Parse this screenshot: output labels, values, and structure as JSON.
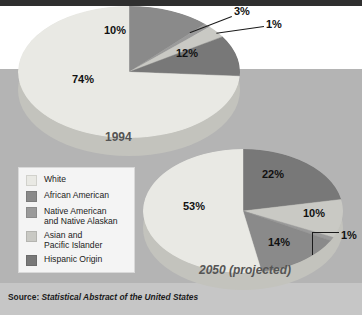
{
  "figure": {
    "source_prefix": "Source:",
    "source_title": "Statistical Abstract of the United States"
  },
  "legend": {
    "items": [
      {
        "label": "White",
        "color": "#e9e9e4"
      },
      {
        "label": "African American",
        "color": "#8a8a8a"
      },
      {
        "label": "Native American\nand Native Alaskan",
        "color": "#9a9a9a"
      },
      {
        "label": "Asian and\nPacific Islander",
        "color": "#c9c9c4"
      },
      {
        "label": "Hispanic Origin",
        "color": "#787878"
      }
    ]
  },
  "chart_data": [
    {
      "type": "pie",
      "title": "1994",
      "categories": [
        "White",
        "African American",
        "Native American and Native Alaskan",
        "Asian and Pacific Islander",
        "Hispanic Origin"
      ],
      "values": [
        74,
        12,
        1,
        3,
        10
      ],
      "labels": [
        "74%",
        "12%",
        "1%",
        "3%",
        "10%"
      ],
      "colors": [
        "#e9e9e4",
        "#8a8a8a",
        "#9a9a9a",
        "#c9c9c4",
        "#787878"
      ],
      "units": "percent"
    },
    {
      "type": "pie",
      "title": "2050 (projected)",
      "categories": [
        "White",
        "African American",
        "Native American and Native Alaskan",
        "Asian and Pacific Islander",
        "Hispanic Origin"
      ],
      "values": [
        53,
        14,
        1,
        10,
        22
      ],
      "labels": [
        "53%",
        "14%",
        "1%",
        "10%",
        "22%"
      ],
      "colors": [
        "#e9e9e4",
        "#8a8a8a",
        "#9a9a9a",
        "#c9c9c4",
        "#787878"
      ],
      "units": "percent"
    }
  ],
  "pie1994": {
    "year": "1994",
    "p_white": "74%",
    "p_hispanic": "10%",
    "p_asian": "3%",
    "p_native": "1%",
    "p_african": "12%"
  },
  "pie2050": {
    "year": "2050 (projected)",
    "p_white": "53%",
    "p_hispanic": "22%",
    "p_asian": "10%",
    "p_native": "1%",
    "p_african": "14%"
  }
}
